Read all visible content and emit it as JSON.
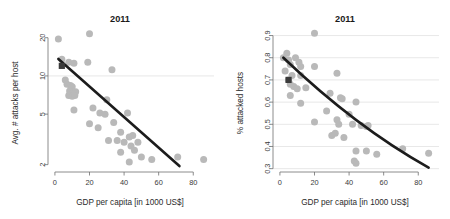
{
  "figure": {
    "panels": [
      {
        "name": "attacks-per-host",
        "title": "2011",
        "xlabel": "GDP per capita [in 1000 US$]",
        "ylabel": "Avg. # attacks per host"
      },
      {
        "name": "attacked-hosts",
        "title": "2011",
        "xlabel": "GDP per capita [in 1000 US$]",
        "ylabel": "% attacked hosts"
      }
    ]
  },
  "colors": {
    "point": "#b9b9b9",
    "fit_line": "#1c1c1c",
    "square_marker": "#3b3b3b",
    "grid": "#d6d6d6",
    "axis": "#6e6e6e",
    "background": "#ffffff"
  },
  "chart_data": [
    {
      "type": "scatter",
      "title": "2011",
      "xlabel": "GDP per capita [in 1000 US$]",
      "ylabel": "Avg. # attacks per host",
      "xlim": [
        -4,
        92
      ],
      "ylim": [
        1.75,
        23
      ],
      "yscale": "log",
      "xscale": "linear",
      "grid": true,
      "gridlines_y": [
        10
      ],
      "xticks": [
        0,
        20,
        40,
        60,
        80
      ],
      "xtick_labels": [
        "0",
        "20",
        "40",
        "60",
        "80"
      ],
      "yticks": [
        2,
        5,
        10,
        20
      ],
      "ytick_labels": [
        "2",
        "5",
        "10",
        "20"
      ],
      "legend": null,
      "points": [
        [
          2,
          19.5
        ],
        [
          20,
          21.5
        ],
        [
          4,
          13.5
        ],
        [
          8,
          12.8
        ],
        [
          11,
          12.6
        ],
        [
          19,
          12.8
        ],
        [
          33,
          11.2
        ],
        [
          6,
          9.3
        ],
        [
          7,
          8.6
        ],
        [
          9,
          8.4
        ],
        [
          10,
          8.2
        ],
        [
          8.5,
          7.6
        ],
        [
          10.5,
          7.4
        ],
        [
          12,
          7.5
        ],
        [
          8,
          7.0
        ],
        [
          10,
          6.9
        ],
        [
          11.5,
          7.0
        ],
        [
          30,
          6.5
        ],
        [
          11,
          5.4
        ],
        [
          22,
          5.6
        ],
        [
          26,
          5.1
        ],
        [
          29,
          5.0
        ],
        [
          42,
          5.1
        ],
        [
          20,
          4.2
        ],
        [
          25,
          3.9
        ],
        [
          34,
          4.3
        ],
        [
          38,
          3.6
        ],
        [
          43,
          3.3
        ],
        [
          31,
          3.1
        ],
        [
          36,
          3.1
        ],
        [
          40,
          3.0
        ],
        [
          45,
          3.4
        ],
        [
          44,
          2.8
        ],
        [
          48,
          3.0
        ],
        [
          46,
          2.6
        ],
        [
          38,
          2.5
        ],
        [
          43,
          2.1
        ],
        [
          50,
          2.3
        ],
        [
          56,
          2.2
        ],
        [
          71,
          2.3
        ],
        [
          86,
          2.2
        ]
      ],
      "annotated_point": {
        "x": 4,
        "y": 12.0,
        "marker": "square"
      },
      "fit": {
        "kind": "log-linear",
        "x_start": 2,
        "x_end": 72,
        "y_start": 13.6,
        "y_end": 1.95
      }
    },
    {
      "type": "scatter",
      "title": "2011",
      "xlabel": "GDP per capita [in 1000 US$]",
      "ylabel": "% attacked hosts",
      "xlim": [
        -4,
        92
      ],
      "ylim": [
        0.285,
        0.925
      ],
      "yscale": "linear",
      "xscale": "linear",
      "grid": true,
      "gridlines_y": [
        0.3,
        0.4,
        0.5,
        0.6,
        0.7,
        0.8,
        0.9
      ],
      "xticks": [
        0,
        20,
        40,
        60,
        80
      ],
      "xtick_labels": [
        "0",
        "20",
        "40",
        "60",
        "80"
      ],
      "yticks": [
        0.3,
        0.4,
        0.5,
        0.6,
        0.7,
        0.8,
        0.9
      ],
      "ytick_labels": [
        "0.3",
        "0.4",
        "0.5",
        "0.6",
        "0.7",
        "0.8",
        "0.9"
      ],
      "legend": null,
      "points": [
        [
          20,
          0.91
        ],
        [
          2,
          0.8
        ],
        [
          4,
          0.82
        ],
        [
          5,
          0.79
        ],
        [
          6,
          0.77
        ],
        [
          9,
          0.8
        ],
        [
          11,
          0.78
        ],
        [
          12,
          0.76
        ],
        [
          20,
          0.76
        ],
        [
          3,
          0.74
        ],
        [
          7,
          0.72
        ],
        [
          12,
          0.72
        ],
        [
          33,
          0.73
        ],
        [
          5,
          0.7
        ],
        [
          6,
          0.68
        ],
        [
          8,
          0.67
        ],
        [
          10,
          0.66
        ],
        [
          15,
          0.665
        ],
        [
          29,
          0.64
        ],
        [
          35,
          0.62
        ],
        [
          36,
          0.615
        ],
        [
          6,
          0.63
        ],
        [
          12,
          0.595
        ],
        [
          44,
          0.6
        ],
        [
          27,
          0.56
        ],
        [
          20,
          0.51
        ],
        [
          33,
          0.52
        ],
        [
          40,
          0.545
        ],
        [
          42,
          0.5
        ],
        [
          47,
          0.495
        ],
        [
          50,
          0.49
        ],
        [
          51,
          0.495
        ],
        [
          34,
          0.5
        ],
        [
          30,
          0.45
        ],
        [
          37,
          0.44
        ],
        [
          32,
          0.46
        ],
        [
          44,
          0.38
        ],
        [
          50,
          0.38
        ],
        [
          56,
          0.365
        ],
        [
          43,
          0.335
        ],
        [
          44,
          0.325
        ],
        [
          71,
          0.39
        ],
        [
          86,
          0.37
        ]
      ],
      "annotated_point": {
        "x": 5,
        "y": 0.7,
        "marker": "square"
      },
      "fit": {
        "kind": "exponential-decay",
        "x_start": 2,
        "x_end": 86,
        "y_start": 0.8,
        "y_mid": 0.52,
        "y_end": 0.305
      }
    }
  ]
}
